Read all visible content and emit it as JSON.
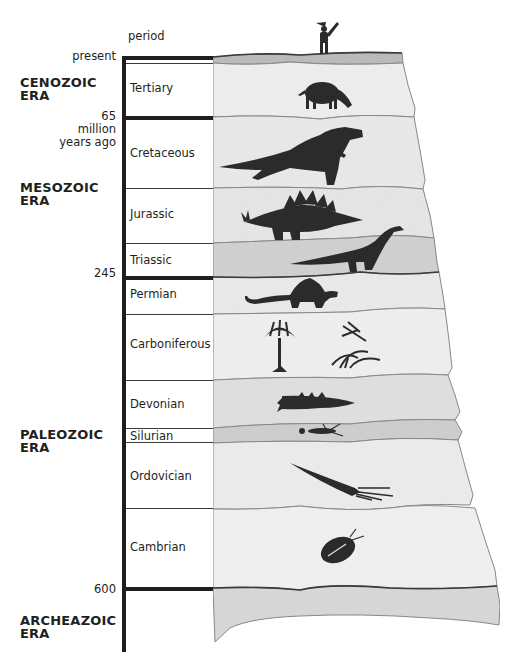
{
  "header": {
    "column_label": "period",
    "present_label": "present"
  },
  "ages": [
    {
      "value": "65",
      "unit_line1": "million",
      "unit_line2": "years ago"
    },
    {
      "value": "245"
    },
    {
      "value": "600"
    }
  ],
  "eras": [
    {
      "line1": "CENOZOIC",
      "line2": "ERA"
    },
    {
      "line1": "MESOZOIC",
      "line2": "ERA"
    },
    {
      "line1": "PALEOZOIC",
      "line2": "ERA"
    },
    {
      "line1": "ARCHEAZOIC",
      "line2": "ERA"
    }
  ],
  "periods": [
    {
      "name": "Tertiary",
      "era": "Cenozoic",
      "fossil": "grazing-mammal"
    },
    {
      "name": "Cretaceous",
      "era": "Mesozoic",
      "fossil": "tyrannosaurus"
    },
    {
      "name": "Jurassic",
      "era": "Mesozoic",
      "fossil": "stegosaurus"
    },
    {
      "name": "Triassic",
      "era": "Mesozoic",
      "fossil": "prosauropod"
    },
    {
      "name": "Permian",
      "era": "Paleozoic",
      "fossil": "sail-reptile"
    },
    {
      "name": "Carboniferous",
      "era": "Paleozoic",
      "fossil": "tree-fern-dragonfly"
    },
    {
      "name": "Devonian",
      "era": "Paleozoic",
      "fossil": "fish"
    },
    {
      "name": "Silurian",
      "era": "Paleozoic",
      "fossil": "sea-scorpion"
    },
    {
      "name": "Ordovician",
      "era": "Paleozoic",
      "fossil": "nautiloid"
    },
    {
      "name": "Cambrian",
      "era": "Paleozoic",
      "fossil": "trilobite"
    }
  ],
  "colors": {
    "ink": "#1e1e1e",
    "layer_light": "#efefef",
    "layer_mid": "#e3e3e3",
    "layer_dark": "#cfcfcf",
    "silhouette": "#2b2b2b"
  }
}
